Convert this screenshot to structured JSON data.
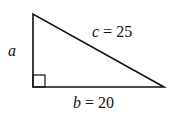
{
  "figure": {
    "type": "right-triangle",
    "labels": {
      "a": {
        "var": "a",
        "eq": "",
        "value": ""
      },
      "b": {
        "var": "b",
        "eq": " = ",
        "value": "20"
      },
      "c": {
        "var": "c",
        "eq": " = ",
        "value": "25"
      }
    },
    "right_angle": "bottom-left",
    "stroke_color": "#111111"
  }
}
